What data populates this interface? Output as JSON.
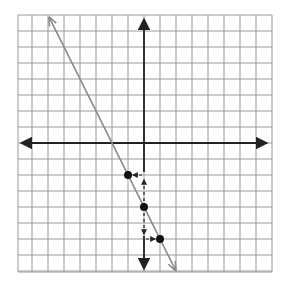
{
  "graph": {
    "title": "Graph of a line on a coordinate grid",
    "equation": "y = -2x - 4",
    "slope": -2,
    "y_intercept": -4,
    "x_range": [
      -8,
      8
    ],
    "y_range": [
      -8,
      8
    ],
    "grid_step": 1,
    "colors": {
      "grid": "#9a9a9a",
      "axes": "#222222",
      "line": "#8a8a8a",
      "points": "#111111",
      "background": "#ffffff"
    }
  },
  "chart_data": {
    "type": "line",
    "title": "",
    "xlabel": "",
    "ylabel": "",
    "xlim": [
      -8,
      8
    ],
    "ylim": [
      -8,
      8
    ],
    "grid": true,
    "series": [
      {
        "name": "y = -2x - 4",
        "x": [
          -5.9,
          1.95
        ],
        "y": [
          7.8,
          -7.9
        ]
      }
    ],
    "points": [
      {
        "x": -1,
        "y": -2
      },
      {
        "x": 0,
        "y": -4
      },
      {
        "x": 1,
        "y": -6
      }
    ],
    "annotations": [
      {
        "type": "dashed-arrow",
        "from": [
          0,
          -4
        ],
        "to": [
          0,
          -2
        ],
        "meaning": "rise +2"
      },
      {
        "type": "dashed-arrow",
        "from": [
          0,
          -2
        ],
        "to": [
          -1,
          -2
        ],
        "meaning": "run -1"
      },
      {
        "type": "dashed-arrow",
        "from": [
          0,
          -4
        ],
        "to": [
          0,
          -6
        ],
        "meaning": "fall -2"
      },
      {
        "type": "dashed-arrow",
        "from": [
          0,
          -6
        ],
        "to": [
          1,
          -6
        ],
        "meaning": "run +1"
      }
    ]
  }
}
